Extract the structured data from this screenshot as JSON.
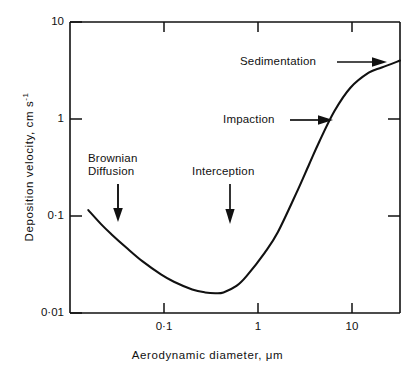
{
  "chart_data": {
    "type": "line",
    "title": "",
    "xlabel": "Aerodynamic diameter, μm",
    "ylabel_text": "Deposition velocity, cm s",
    "ylabel_exponent": "-1",
    "xscale": "log",
    "yscale": "log",
    "xlim": [
      0.02,
      30
    ],
    "ylim": [
      0.01,
      10
    ],
    "grid": false,
    "legend": "none",
    "xticks": [
      0.1,
      1,
      10
    ],
    "xtick_labels": [
      "0·1",
      "1",
      "10"
    ],
    "yticks": [
      0.01,
      0.1,
      1,
      10
    ],
    "ytick_labels": [
      "0·01",
      "0·1",
      "1",
      "10"
    ],
    "series": [
      {
        "name": "Deposition velocity curve",
        "x": [
          0.03,
          0.04,
          0.05,
          0.07,
          0.1,
          0.15,
          0.2,
          0.3,
          0.4,
          0.5,
          0.6,
          0.8,
          1.0,
          1.5,
          2.0,
          3.0,
          4.0,
          5.0,
          7.0,
          10.0,
          15.0,
          20.0,
          30.0
        ],
        "y": [
          0.115,
          0.082,
          0.065,
          0.047,
          0.034,
          0.025,
          0.021,
          0.0175,
          0.0163,
          0.016,
          0.0163,
          0.019,
          0.024,
          0.042,
          0.068,
          0.17,
          0.34,
          0.58,
          1.2,
          2.1,
          3.0,
          3.4,
          4.0
        ]
      }
    ],
    "annotations": [
      {
        "id": "brownian-diffusion",
        "label_line1": "Brownian",
        "label_line2": "Diffusion",
        "arrow": "down",
        "target_x": 0.038,
        "target_y": 0.085
      },
      {
        "id": "interception",
        "label_line1": "Interception",
        "label_line2": "",
        "arrow": "down",
        "target_x": 0.5,
        "target_y": 0.075
      },
      {
        "id": "impaction",
        "label_line1": "Impaction",
        "label_line2": "",
        "arrow": "right",
        "target_x": 5.0,
        "target_y": 0.85
      },
      {
        "id": "sedimentation",
        "label_line1": "Sedimentation",
        "label_line2": "",
        "arrow": "right",
        "target_x": 22.0,
        "target_y": 4.2
      }
    ],
    "colors": {
      "curve": "#111111",
      "axis": "#111111",
      "background": "#ffffff"
    }
  }
}
